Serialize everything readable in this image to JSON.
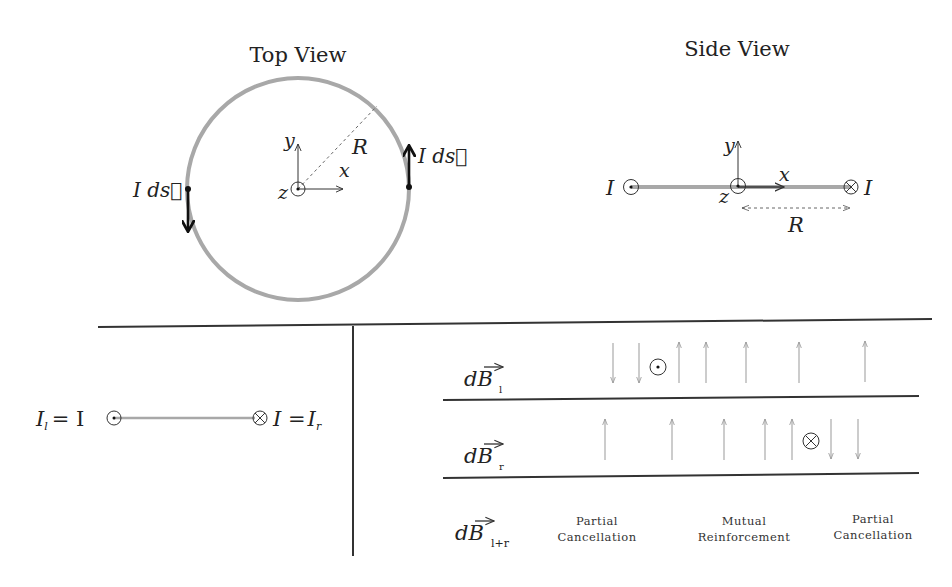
{
  "top_view": {
    "title": "Top View",
    "labels": {
      "y": "y",
      "x": "x",
      "z": "z",
      "R": "R",
      "current_element_right": "I ds⃗",
      "current_element_left": "I ds⃗"
    },
    "center": [
      298,
      189
    ],
    "radius": 111,
    "loop_color": "#a8a8a8"
  },
  "side_view": {
    "title": "Side View",
    "labels": {
      "I_left": "I",
      "I_right": "I",
      "y": "y",
      "x": "x",
      "z": "z",
      "R": "R"
    },
    "left_symbol": "out-of-page",
    "right_symbol": "into-page"
  },
  "bottom_left": {
    "left_label": "I",
    "left_sub": "l",
    "left_eq": "= I",
    "right_eq": "I =",
    "right_label": "I",
    "right_sub": "r"
  },
  "bottom_right": {
    "rows": [
      {
        "label": "dB",
        "sub": "l",
        "source_symbol": "out-of-page",
        "arrows": [
          {
            "x": 613,
            "dir": "down"
          },
          {
            "x": 639,
            "dir": "down"
          },
          {
            "x": 679,
            "dir": "up"
          },
          {
            "x": 706,
            "dir": "up"
          },
          {
            "x": 746,
            "dir": "up"
          },
          {
            "x": 799,
            "dir": "up"
          },
          {
            "x": 865,
            "dir": "up"
          }
        ]
      },
      {
        "label": "dB",
        "sub": "r",
        "source_symbol": "into-page",
        "arrows": [
          {
            "x": 605,
            "dir": "up"
          },
          {
            "x": 672,
            "dir": "up"
          },
          {
            "x": 724,
            "dir": "up"
          },
          {
            "x": 765,
            "dir": "up"
          },
          {
            "x": 792,
            "dir": "up"
          },
          {
            "x": 831,
            "dir": "down"
          },
          {
            "x": 858,
            "dir": "down"
          }
        ]
      },
      {
        "label": "dB",
        "sub": "l+r"
      }
    ],
    "annotations": [
      {
        "line1": "Partial",
        "line2": "Cancellation"
      },
      {
        "line1": "Mutual",
        "line2": "Reinforcement"
      },
      {
        "line1": "Partial",
        "line2": "Cancellation"
      }
    ]
  }
}
